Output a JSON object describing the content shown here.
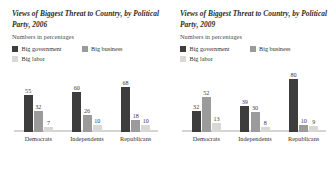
{
  "charts": [
    {
      "title": "Views of Biggest Threat to Country, by Political Party, 2006",
      "subtitle": "Numbers in percentages",
      "legend": [
        "Big government",
        "Big business",
        "Big labor"
      ],
      "categories": [
        "Democrats",
        "Independents",
        "Republicans"
      ],
      "values": [
        [
          55,
          32,
          7
        ],
        [
          60,
          26,
          10
        ],
        [
          68,
          18,
          10
        ]
      ]
    },
    {
      "title": "Views of Biggest Threat to Country, by Political Party, 2009",
      "subtitle": "Numbers in percentages",
      "legend": [
        "Big government",
        "Big business",
        "Big labor"
      ],
      "categories": [
        "Democrats",
        "Independents",
        "Republicans"
      ],
      "values": [
        [
          32,
          52,
          13
        ],
        [
          39,
          30,
          8
        ],
        [
          80,
          10,
          9
        ]
      ]
    }
  ],
  "colors": {
    "big_government": "#3d3d3d",
    "big_business": "#9b9b9b",
    "big_labor": "#d8d8d6",
    "baseline": "#d4d4d2",
    "text": "#2f2f2f"
  },
  "chart_data": [
    {
      "type": "bar",
      "title": "Views of Biggest Threat to Country, by Political Party, 2006",
      "subtitle": "Numbers in percentages",
      "xlabel": "",
      "ylabel": "Percent",
      "ylim": [
        0,
        85
      ],
      "grid": false,
      "legend_position": "top-left",
      "categories": [
        "Democrats",
        "Independents",
        "Republicans"
      ],
      "series": [
        {
          "name": "Big government",
          "values": [
            55,
            60,
            68
          ],
          "color": "#3d3d3d"
        },
        {
          "name": "Big business",
          "values": [
            32,
            26,
            18
          ],
          "color": "#9b9b9b"
        },
        {
          "name": "Big labor",
          "values": [
            7,
            10,
            10
          ],
          "color": "#d8d8d6"
        }
      ]
    },
    {
      "type": "bar",
      "title": "Views of Biggest Threat to Country, by Political Party, 2009",
      "subtitle": "Numbers in percentages",
      "xlabel": "",
      "ylabel": "Percent",
      "ylim": [
        0,
        85
      ],
      "grid": false,
      "legend_position": "top-left",
      "categories": [
        "Democrats",
        "Independents",
        "Republicans"
      ],
      "series": [
        {
          "name": "Big government",
          "values": [
            32,
            39,
            80
          ],
          "color": "#3d3d3d"
        },
        {
          "name": "Big business",
          "values": [
            52,
            30,
            10
          ],
          "color": "#9b9b9b"
        },
        {
          "name": "Big labor",
          "values": [
            13,
            8,
            9
          ],
          "color": "#d8d8d6"
        }
      ]
    }
  ]
}
